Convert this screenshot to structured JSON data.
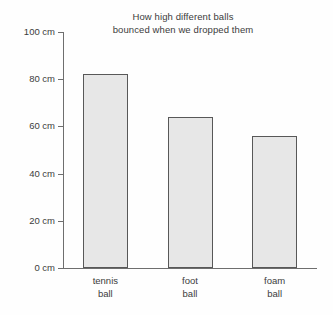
{
  "chart_data": {
    "type": "bar",
    "title": "How high different balls\nbounced when we dropped them",
    "xlabel": "",
    "ylabel": "",
    "categories": [
      "tennis\nball",
      "foot\nball",
      "foam\nball"
    ],
    "category_names": [
      "tennis ball",
      "foot ball",
      "foam ball"
    ],
    "values": [
      82,
      64,
      56
    ],
    "unit": "cm",
    "ylim": [
      0,
      100
    ],
    "ytick_values": [
      0,
      20,
      40,
      60,
      80,
      100
    ],
    "ytick_labels": [
      "0 cm",
      "20 cm",
      "40 cm",
      "60 cm",
      "80 cm",
      "100 cm"
    ],
    "grid": false,
    "legend": null,
    "bar_fill_color": "#e7e7e7",
    "bar_edge_color": "#585858",
    "axis_color": "#6e6e6e",
    "text_color": "#3c3c3c",
    "background_color": "#fefefe"
  }
}
